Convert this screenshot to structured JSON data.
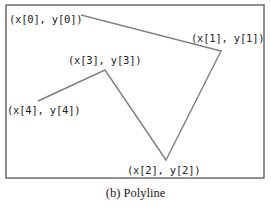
{
  "caption": "(b) Polyline",
  "frame": {
    "x": 6,
    "y": 5,
    "width": 258,
    "height": 173,
    "stroke": "#555555"
  },
  "polyline": {
    "stroke": "#808080",
    "points": [
      {
        "name": "p0",
        "x": 81,
        "y": 15
      },
      {
        "name": "p1",
        "x": 221,
        "y": 51
      },
      {
        "name": "p2",
        "x": 166,
        "y": 160
      },
      {
        "name": "p3",
        "x": 105,
        "y": 70
      },
      {
        "name": "p4",
        "x": 38,
        "y": 101
      }
    ]
  },
  "labels": {
    "p0": "(x[0], y[0])",
    "p1": "(x[1], y[1])",
    "p2": "(x[2], y[2])",
    "p3": "(x[3], y[3])",
    "p4": "(x[4], y[4])"
  }
}
